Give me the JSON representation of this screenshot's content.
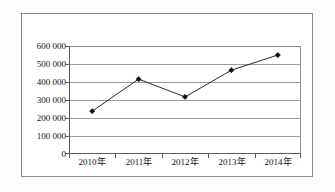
{
  "chart_data": {
    "type": "line",
    "title": "",
    "subtitle": "",
    "xlabel": "",
    "ylabel": "",
    "categories": [
      "2010年",
      "2011年",
      "2012年",
      "2013年",
      "2014年"
    ],
    "values": [
      240000,
      420000,
      320000,
      470000,
      555000
    ],
    "series": [
      {
        "name": "",
        "values": [
          240000,
          420000,
          320000,
          470000,
          555000
        ]
      }
    ],
    "ylim": [
      0,
      600000
    ],
    "ytick_values": [
      0,
      100000,
      200000,
      300000,
      400000,
      500000,
      600000
    ],
    "ytick_labels": [
      "0",
      "100 000",
      "200 000",
      "300 000",
      "400 000",
      "500 000",
      "600 000"
    ],
    "xtick_labels": [
      "2010年",
      "2011年",
      "2012年",
      "2013年",
      "2014年"
    ],
    "grid": true,
    "grid_axis": "y",
    "legend": false,
    "legend_position": "none",
    "marker": "diamond",
    "line_color": "#2b2b2b",
    "marker_color": "#101010",
    "grid_color": "#9b9b9b",
    "axis_color": "#5a5a5a",
    "background_color": "#ffffff",
    "annotations": []
  }
}
